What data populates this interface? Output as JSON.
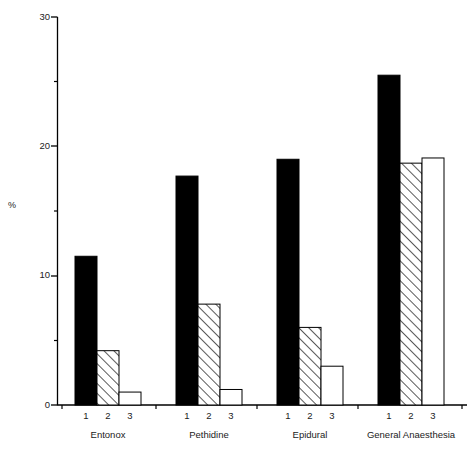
{
  "chart_data": {
    "type": "bar",
    "title": "",
    "xlabel": "",
    "ylabel": "%",
    "ylim": [
      0,
      30
    ],
    "ytick_values": [
      0,
      10,
      20,
      30
    ],
    "ytick_labels": [
      "0",
      "10",
      "20",
      "30"
    ],
    "yminor_ticks": [
      5,
      15,
      25
    ],
    "grid": false,
    "legend": "none",
    "categories": [
      "Entonox",
      "Pethidine",
      "Epidural",
      "General Anaesthesia"
    ],
    "subgroup_labels": [
      "1",
      "2",
      "3"
    ],
    "series": [
      {
        "name": "1",
        "fill": "solid-black",
        "values": [
          11.5,
          17.7,
          19.0,
          25.5
        ]
      },
      {
        "name": "2",
        "fill": "diagonal-hatch",
        "values": [
          4.2,
          7.8,
          6.0,
          18.7
        ]
      },
      {
        "name": "3",
        "fill": "white",
        "values": [
          1.0,
          1.2,
          3.0,
          19.1
        ]
      }
    ],
    "colors": {
      "bar_solid": "#000000",
      "bar_hatch_line": "#000000",
      "bar_hatch_background": "#ffffff",
      "bar_open": "#ffffff",
      "bar_outline": "#000000",
      "axis": "#000000",
      "background": "#ffffff",
      "text": "#1a1a1a"
    }
  },
  "axis": {
    "y_label": "%",
    "y_labels": [
      "30",
      "20",
      "10",
      "0"
    ],
    "x_group_labels": [
      "Entonox",
      "Pethidine",
      "Epidural",
      "General Anaesthesia"
    ],
    "x_sub_labels": [
      "1",
      "2",
      "3",
      "1",
      "2",
      "3",
      "1",
      "2",
      "3",
      "1",
      "2",
      "3"
    ]
  }
}
